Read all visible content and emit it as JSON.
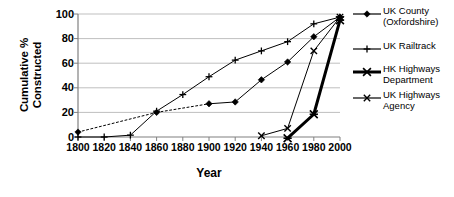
{
  "chart_data": {
    "type": "line",
    "title": "",
    "xlabel": "Year",
    "ylabel": "Cumulative % Constructed",
    "ylabel_line1": "Cumulative %",
    "ylabel_line2": "Constructed",
    "xlim": [
      1800,
      2000
    ],
    "ylim": [
      0,
      100
    ],
    "xticks": [
      1800,
      1820,
      1840,
      1860,
      1880,
      1900,
      1920,
      1940,
      1960,
      1980,
      2000
    ],
    "yticks": [
      0,
      20,
      40,
      60,
      80,
      100
    ],
    "grid": "horizontal",
    "legend_position": "right",
    "series": [
      {
        "name": "UK County (Oxfordshire)",
        "name_line1": "UK County",
        "name_line2": "(Oxfordshire)",
        "marker": "diamond",
        "linestyle": "dotted-then-solid",
        "linewidth": 1,
        "color": "#000000",
        "x": [
          1800,
          1860,
          1900,
          1920,
          1940,
          1960,
          1980,
          2000
        ],
        "y": [
          4,
          20,
          27,
          28.5,
          46.5,
          61,
          81.5,
          97.5
        ]
      },
      {
        "name": "UK Railtrack",
        "name_line1": "UK Railtrack",
        "name_line2": "",
        "marker": "plus",
        "linestyle": "solid",
        "linewidth": 1,
        "color": "#000000",
        "x": [
          1800,
          1820,
          1840,
          1860,
          1880,
          1900,
          1920,
          1940,
          1960,
          1980,
          2000
        ],
        "y": [
          0,
          0,
          1.5,
          21,
          34.5,
          49,
          62.5,
          70,
          77.5,
          92,
          97.5
        ]
      },
      {
        "name": "HK Highways Department",
        "name_line1": "HK Highways",
        "name_line2": "Department",
        "marker": "asterisk",
        "linestyle": "solid",
        "linewidth": 3,
        "color": "#000000",
        "x": [
          1960,
          1980,
          2000
        ],
        "y": [
          -1,
          18.5,
          95
        ]
      },
      {
        "name": "UK Highways Agency",
        "name_line1": "UK Highways",
        "name_line2": "Agency",
        "marker": "x",
        "linestyle": "solid",
        "linewidth": 1,
        "color": "#000000",
        "x": [
          1940,
          1960,
          1980,
          2000
        ],
        "y": [
          1,
          7,
          70,
          97.5
        ]
      }
    ]
  },
  "axes": {
    "y_tick_labels": [
      "100",
      "80",
      "60",
      "40",
      "20",
      "0"
    ],
    "x_tick_labels": [
      "1800",
      "1820",
      "1840",
      "1860",
      "1880",
      "1900",
      "1920",
      "1940",
      "1960",
      "1980",
      "2000"
    ]
  },
  "legend": {
    "items": [
      {
        "key": "diamond-line-key",
        "line1": "UK County",
        "line2": "(Oxfordshire)"
      },
      {
        "key": "plus-line-key",
        "line1": "UK Railtrack",
        "line2": ""
      },
      {
        "key": "asterisk-thick-line-key",
        "line1": "HK Highways",
        "line2": "Department"
      },
      {
        "key": "x-line-key",
        "line1": "UK Highways",
        "line2": "Agency"
      }
    ]
  },
  "style": {
    "axis_color": "#808080",
    "grid_color": "#bfbfbf",
    "series_color": "#000000",
    "background": "#ffffff"
  }
}
